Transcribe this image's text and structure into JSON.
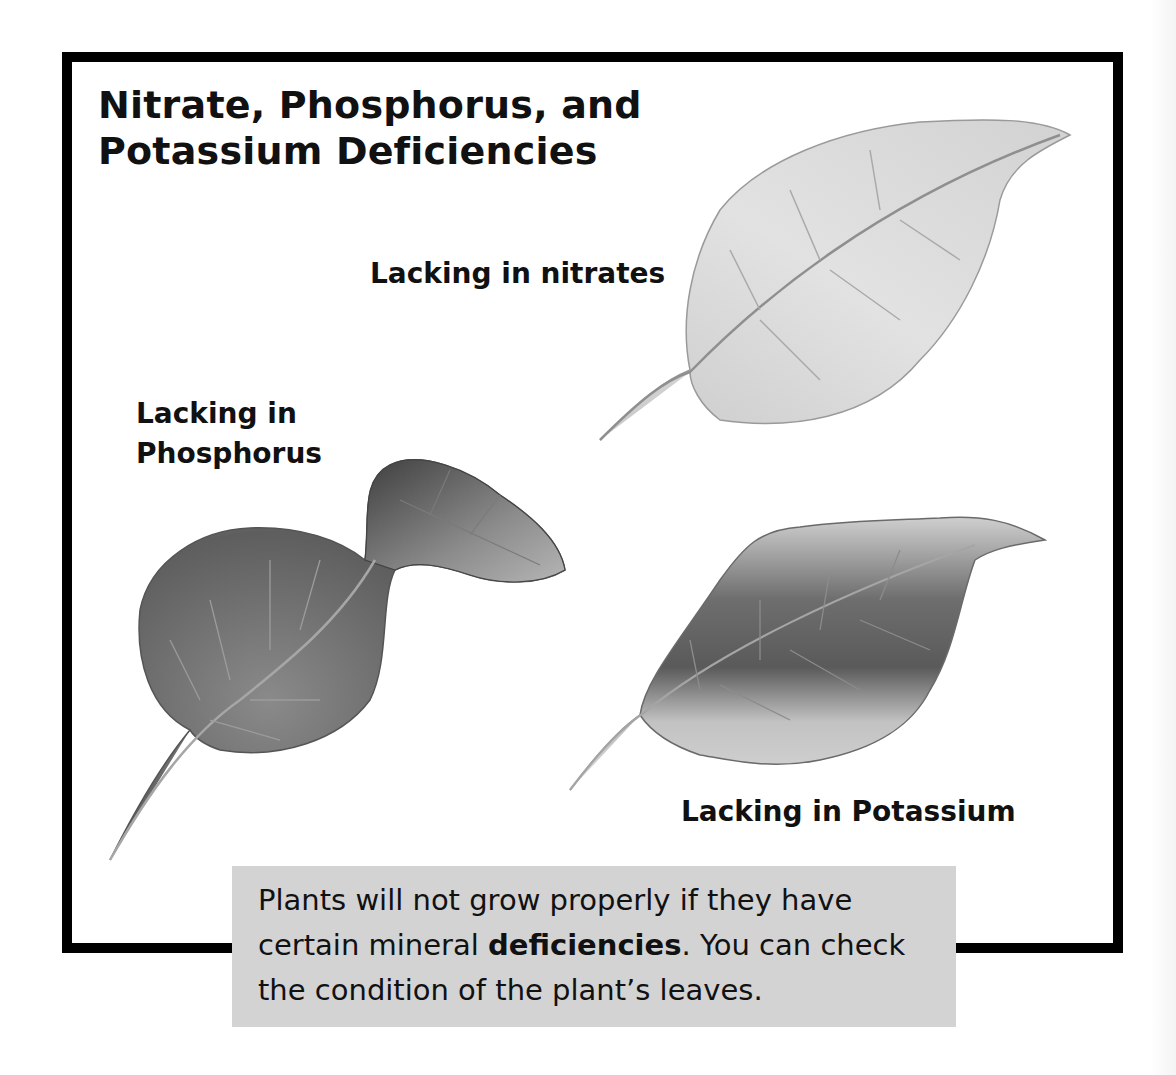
{
  "title": "Nitrate, Phosphorus, and\nPotassium Deficiencies",
  "leaves": [
    {
      "id": "nitrates",
      "label": "Lacking in nitrates",
      "shade": "light"
    },
    {
      "id": "phosphorus",
      "label": "Lacking in\nPhosphorus",
      "shade": "dark-curled"
    },
    {
      "id": "potassium",
      "label": "Lacking in Potassium",
      "shade": "dark-center-pale-edges"
    }
  ],
  "caption": {
    "before": "Plants will not grow properly if they have certain mineral ",
    "bold": "deficiencies",
    "after": ". You can check the condition of the plant’s leaves."
  },
  "colors": {
    "frame": "#000000",
    "caption_bg": "#d3d3d3",
    "background": "#ffffff"
  }
}
